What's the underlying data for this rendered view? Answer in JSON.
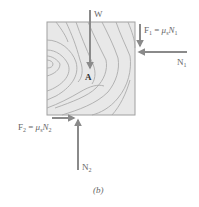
{
  "figure": {
    "caption": "(b)",
    "point_label": "A",
    "colors": {
      "arrow": "#8a8a8a",
      "block_fill": "#e6e6e6",
      "block_border": "#9a9a9a",
      "grain": "#a8a8a8",
      "text": "#666666"
    }
  },
  "forces": {
    "W": {
      "label": "W",
      "direction": "down"
    },
    "F1": {
      "label_main": "F",
      "label_sub": "1",
      "eq": " = ",
      "mu": "μ",
      "mu_sub": "s",
      "N": "N",
      "N_sub": "1",
      "direction": "down"
    },
    "N1": {
      "label_main": "N",
      "label_sub": "1",
      "direction": "left"
    },
    "F2": {
      "label_main": "F",
      "label_sub": "2",
      "eq": " = ",
      "mu": "μ",
      "mu_sub": "s",
      "N": "N",
      "N_sub": "2",
      "direction": "right"
    },
    "N2": {
      "label_main": "N",
      "label_sub": "2",
      "direction": "up"
    }
  }
}
